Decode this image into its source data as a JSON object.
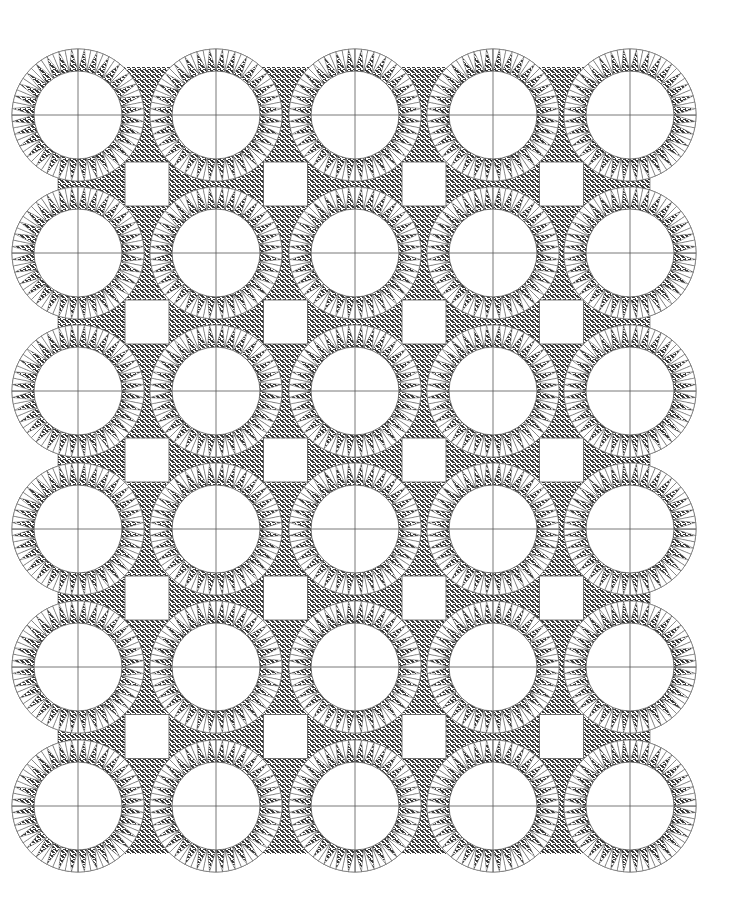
{
  "figure": {
    "kind": "quilt-pattern-line-drawing",
    "rows": 6,
    "cols": 5,
    "col_centers": [
      78,
      216,
      355,
      493,
      630
    ],
    "row_centers": [
      115,
      253,
      391,
      529,
      667,
      806
    ],
    "ring_outer_radius": 66,
    "ring_inner_radius": 44,
    "spikes_per_ring": 32,
    "square_size": 44,
    "colors": {
      "background": "#ffffff",
      "line": "#555555",
      "fabric_dark": "#3a3a3a",
      "fabric_light": "#ffffff"
    }
  }
}
